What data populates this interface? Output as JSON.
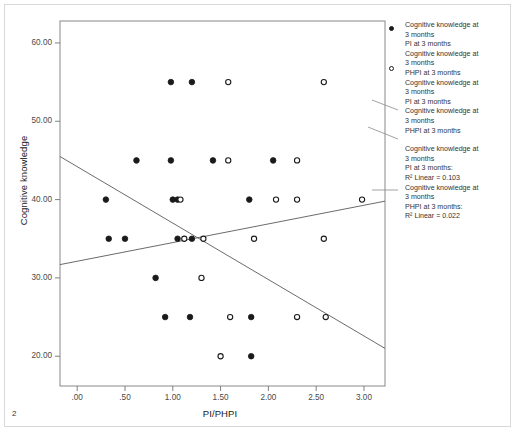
{
  "page": {
    "number": "2"
  },
  "chart_data": {
    "type": "scatter",
    "title": "",
    "xlabel": "PI/PHPI",
    "ylabel": "Cognitive knowledge",
    "xlim": [
      -0.18,
      3.22
    ],
    "ylim": [
      16.2,
      62.8
    ],
    "xticks": [
      ".00",
      ".50",
      "1.00",
      "1.50",
      "2.00",
      "2.50",
      "3.00"
    ],
    "xtick_values": [
      0.0,
      0.5,
      1.0,
      1.5,
      2.0,
      2.5,
      3.0
    ],
    "yticks": [
      "60.00",
      "50.00",
      "40.00",
      "30.00",
      "20.00"
    ],
    "ytick_values": [
      60,
      50,
      40,
      30,
      20
    ],
    "grid": false,
    "legend_position": "right",
    "series": [
      {
        "name": "PI at 3 months",
        "marker": "filled-circle",
        "color": "#1a1a1a",
        "points": [
          [
            0.3,
            40.0
          ],
          [
            0.33,
            35.0
          ],
          [
            0.5,
            35.0
          ],
          [
            0.62,
            45.0
          ],
          [
            0.82,
            30.0
          ],
          [
            0.92,
            25.0
          ],
          [
            0.98,
            55.0
          ],
          [
            0.98,
            45.0
          ],
          [
            1.0,
            40.0
          ],
          [
            1.05,
            40.0
          ],
          [
            1.05,
            35.0
          ],
          [
            1.18,
            25.0
          ],
          [
            1.2,
            35.0
          ],
          [
            1.2,
            55.0
          ],
          [
            1.42,
            45.0
          ],
          [
            1.8,
            40.0
          ],
          [
            1.82,
            25.0
          ],
          [
            1.82,
            20.0
          ],
          [
            2.05,
            45.0
          ]
        ]
      },
      {
        "name": "PHPI at 3 months",
        "marker": "hollow-circle",
        "color": "#1a1a1a",
        "points": [
          [
            1.08,
            40.0
          ],
          [
            1.12,
            35.0
          ],
          [
            1.3,
            30.0
          ],
          [
            1.32,
            35.0
          ],
          [
            1.58,
            45.0
          ],
          [
            1.58,
            55.0
          ],
          [
            1.5,
            20.0
          ],
          [
            1.6,
            25.0
          ],
          [
            1.85,
            35.0
          ],
          [
            2.08,
            40.0
          ],
          [
            2.3,
            40.0
          ],
          [
            2.3,
            25.0
          ],
          [
            2.3,
            45.0
          ],
          [
            2.58,
            55.0
          ],
          [
            2.58,
            35.0
          ],
          [
            2.6,
            25.0
          ],
          [
            2.98,
            40.0
          ]
        ]
      }
    ],
    "fit_lines": [
      {
        "name": "PI at 3 months fit",
        "r2_linear": 0.103,
        "slope_sign": "negative",
        "x0": -0.18,
        "y0": 45.5,
        "x1": 3.22,
        "y1": 21.0
      },
      {
        "name": "PHPI at 3 months fit",
        "r2_linear": 0.022,
        "slope_sign": "positive",
        "x0": -0.18,
        "y0": 31.7,
        "x1": 3.22,
        "y1": 39.8
      }
    ]
  },
  "legend": {
    "entries": [
      {
        "marker": "filled-circle",
        "lines": [
          "Cognitive knowledge at",
          "3 months",
          "PI at 3 months"
        ]
      },
      {
        "marker": "hollow-circle",
        "lines": [
          "Cognitive knowledge at",
          "3 months",
          "PHPI at 3 months"
        ]
      },
      {
        "marker": "line-callout",
        "lines": [
          "Cognitive knowledge at",
          "3 months",
          "PI at 3 months"
        ]
      },
      {
        "marker": "line-callout",
        "lines": [
          "Cognitive knowledge at",
          "3 months",
          "PHPI at 3 months"
        ]
      },
      {
        "marker": "fit-callout",
        "lines": [
          "Cognitive knowledge at",
          "3 months",
          "PI at 3 months:",
          "R² Linear = 0.103"
        ]
      },
      {
        "marker": "fit-callout",
        "lines": [
          "Cognitive knowledge at",
          "3 months",
          "PHPI at 3 months:",
          "R² Linear = 0.022"
        ]
      }
    ]
  },
  "colors": {
    "marker": "#1a1a1a",
    "axis": "#808080",
    "plot_border": "#888888",
    "text": "#1a1a1a",
    "tick_text": "#4a4a4a",
    "figure_border": "#d8d8d8"
  }
}
